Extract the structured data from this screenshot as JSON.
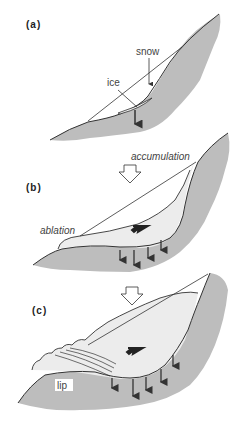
{
  "figure": {
    "panels": [
      {
        "id": "a",
        "label": "(a)",
        "annotations": [
          "snow",
          "ice"
        ]
      },
      {
        "id": "b",
        "label": "(b)",
        "annotations": [
          "accumulation",
          "ablation"
        ]
      },
      {
        "id": "c",
        "label": "(c)",
        "annotations": [
          "lip"
        ]
      }
    ],
    "colors": {
      "bedrock": "#bdbdbd",
      "ice": "#ececec",
      "line": "#333333",
      "background": "#ffffff"
    },
    "transition_arrows": 2
  }
}
